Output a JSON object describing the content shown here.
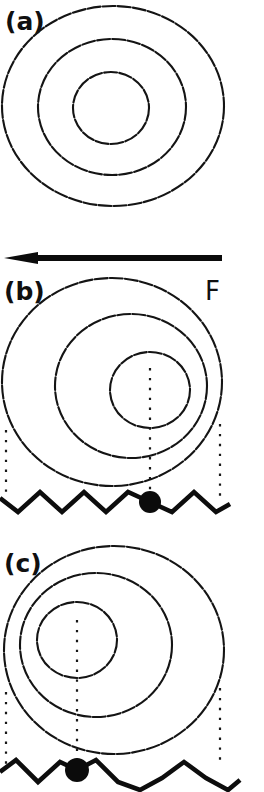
{
  "figure": {
    "background_color": "#ffffff",
    "ink_color": "#111111",
    "width": 264,
    "height": 792,
    "panels": [
      {
        "id": "a",
        "label": "(a)",
        "label_x": 5,
        "label_y": 30,
        "description": "symmetric concentric contours, no substrate, no pinned particle",
        "contours": [
          {
            "cx": 113,
            "cy": 106,
            "rx": 111,
            "ry": 100
          },
          {
            "cx": 112,
            "cy": 107,
            "rx": 74,
            "ry": 68
          },
          {
            "cx": 111,
            "cy": 108,
            "rx": 38,
            "ry": 36
          }
        ],
        "has_substrate": false,
        "has_particle": false,
        "has_guides": false
      },
      {
        "id": "b",
        "label": "(b)",
        "label_x": 4,
        "label_y": 300,
        "description": "contours displaced toward the right under applied force F; particle pinned at substrate minimum",
        "contours": [
          {
            "cx": 112,
            "cy": 382,
            "rx": 110,
            "ry": 104
          },
          {
            "cx": 131,
            "cy": 386,
            "rx": 76,
            "ry": 72
          },
          {
            "cx": 150,
            "cy": 390,
            "rx": 40,
            "ry": 38
          }
        ],
        "has_substrate": true,
        "has_particle": true,
        "has_guides": true,
        "particle": {
          "cx": 150,
          "cy": 502,
          "r": 11
        },
        "guides": [
          {
            "x": 6,
            "y1": 430,
            "y2": 496
          },
          {
            "x": 150,
            "y1": 368,
            "y2": 494
          },
          {
            "x": 220,
            "y1": 424,
            "y2": 496
          }
        ],
        "substrate": {
          "y_top": 492,
          "y_bottom": 512,
          "points": "0,498 18,512 40,492 62,512 84,492 106,512 128,492 150,502 172,512 194,492 216,512 230,504"
        }
      },
      {
        "id": "c",
        "label": "(c)",
        "label_x": 4,
        "label_y": 572,
        "description": "contours displaced toward the left; particle pinned at a different substrate minimum",
        "contours": [
          {
            "cx": 114,
            "cy": 650,
            "rx": 110,
            "ry": 104
          },
          {
            "cx": 96,
            "cy": 645,
            "rx": 76,
            "ry": 72
          },
          {
            "cx": 77,
            "cy": 640,
            "rx": 40,
            "ry": 38
          }
        ],
        "has_substrate": true,
        "has_particle": true,
        "has_guides": true,
        "particle": {
          "cx": 77,
          "cy": 770,
          "r": 12
        },
        "guides": [
          {
            "x": 6,
            "y1": 692,
            "y2": 764
          },
          {
            "x": 77,
            "y1": 620,
            "y2": 760
          },
          {
            "x": 220,
            "y1": 688,
            "y2": 764
          }
        ],
        "substrate": {
          "y_top": 760,
          "y_bottom": 782,
          "points": "0,772 16,760 38,782 60,762 77,770 96,760 118,782 140,790 162,778 184,762 206,778 228,790 240,780"
        }
      }
    ],
    "force_arrow": {
      "label": "F",
      "label_x": 205,
      "label_y": 300,
      "direction": "left",
      "x_tail": 222,
      "x_tip": 4,
      "y": 258,
      "head_length": 34
    }
  }
}
